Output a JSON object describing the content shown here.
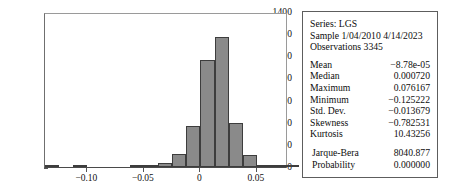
{
  "chart_data": {
    "type": "bar",
    "subtype": "histogram",
    "title": "",
    "xlabel": "",
    "ylabel": "",
    "xlim": [
      -0.1375,
      0.0775
    ],
    "ylim": [
      0,
      1400
    ],
    "grid": false,
    "legend": false,
    "bin_width": 0.0125,
    "y_ticks": [
      0,
      200,
      400,
      600,
      800,
      1000,
      1200,
      1400
    ],
    "y_tick_labels": [
      "0",
      "200",
      "400",
      "600",
      "800",
      "1000",
      "1200",
      "1400"
    ],
    "x_ticks": [
      -0.1,
      -0.05,
      0,
      0.05
    ],
    "x_tick_labels": [
      "−0.10",
      "−0.05",
      "0",
      "0.05"
    ],
    "bar_color": "#8a8a8a",
    "bar_edge_color": "#3d3d3d",
    "bins": [
      {
        "left": -0.1375,
        "right": -0.125,
        "center": -0.13125,
        "count": 3
      },
      {
        "left": -0.125,
        "right": -0.1125,
        "center": -0.11875,
        "count": 0
      },
      {
        "left": -0.1125,
        "right": -0.1,
        "center": -0.10625,
        "count": 2
      },
      {
        "left": -0.1,
        "right": -0.0875,
        "center": -0.09375,
        "count": 0
      },
      {
        "left": -0.0875,
        "right": -0.075,
        "center": -0.08125,
        "count": 0
      },
      {
        "left": -0.075,
        "right": -0.0625,
        "center": -0.06875,
        "count": 0
      },
      {
        "left": -0.0625,
        "right": -0.05,
        "center": -0.05625,
        "count": 4
      },
      {
        "left": -0.05,
        "right": -0.0375,
        "center": -0.04375,
        "count": 12
      },
      {
        "left": -0.0375,
        "right": -0.025,
        "center": -0.03125,
        "count": 35
      },
      {
        "left": -0.025,
        "right": -0.0125,
        "center": -0.01875,
        "count": 120
      },
      {
        "left": -0.0125,
        "right": 0.0,
        "center": -0.00625,
        "count": 370
      },
      {
        "left": 0.0,
        "right": 0.0125,
        "center": 0.00625,
        "count": 965
      },
      {
        "left": 0.0125,
        "right": 0.025,
        "center": 0.01875,
        "count": 1170
      },
      {
        "left": 0.025,
        "right": 0.0375,
        "center": 0.03125,
        "count": 395
      },
      {
        "left": 0.0375,
        "right": 0.05,
        "center": 0.04375,
        "count": 110
      },
      {
        "left": 0.05,
        "right": 0.0625,
        "center": 0.05625,
        "count": 15
      },
      {
        "left": 0.0625,
        "right": 0.075,
        "center": 0.06875,
        "count": 6
      },
      {
        "left": 0.075,
        "right": 0.0875,
        "center": 0.08125,
        "count": 4
      }
    ],
    "categories": [
      "-0.131",
      "-0.119",
      "-0.106",
      "-0.094",
      "-0.081",
      "-0.069",
      "-0.056",
      "-0.044",
      "-0.031",
      "-0.019",
      "-0.006",
      "0.006",
      "0.019",
      "0.031",
      "0.044",
      "0.056",
      "0.069",
      "0.081"
    ],
    "values": [
      3,
      0,
      2,
      0,
      0,
      0,
      4,
      12,
      35,
      120,
      370,
      965,
      1170,
      395,
      110,
      15,
      6,
      4
    ]
  },
  "stats": {
    "header": {
      "series_line": "Series: LGS",
      "sample_line": "Sample 1/04/2010 4/14/2023",
      "observations_line": "Observations 3345"
    },
    "rows": [
      {
        "key": "Mean",
        "value": "−8.78e-05"
      },
      {
        "key": "Median",
        "value": "0.000720"
      },
      {
        "key": "Maximum",
        "value": "0.076167"
      },
      {
        "key": "Minimum",
        "value": "−0.125222"
      },
      {
        "key": "Std. Dev.",
        "value": "−0.013679"
      },
      {
        "key": "Skewness",
        "value": "−0.782531"
      },
      {
        "key": "Kurtosis",
        "value": "10.43256"
      }
    ],
    "test_rows": [
      {
        "key": "Jarque-Bera",
        "value": "8040.877"
      },
      {
        "key": "Probability",
        "value": "0.000000"
      }
    ]
  }
}
